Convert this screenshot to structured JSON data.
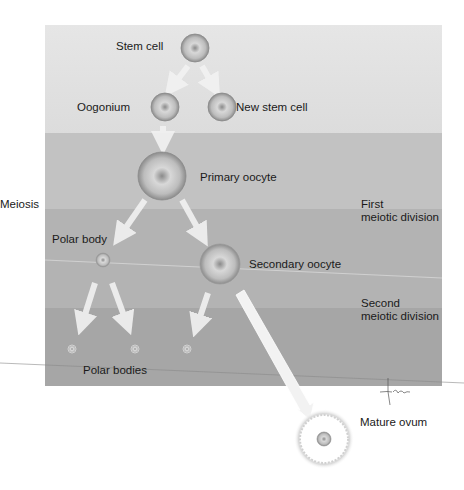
{
  "diagram": {
    "stages": {
      "stem_cell": "Stem cell",
      "oogonium": "Oogonium",
      "new_stem_cell": "New stem cell",
      "primary_oocyte": "Primary oocyte",
      "polar_body": "Polar body",
      "secondary_oocyte": "Secondary oocyte",
      "polar_bodies": "Polar bodies",
      "mature_ovum": "Mature ovum"
    },
    "process_label": "Meiosis",
    "phases": {
      "first_line1": "First",
      "first_line2": "meiotic division",
      "second_line1": "Second",
      "second_line2": "meiotic division"
    },
    "colors": {
      "band1": "#e0e0e0",
      "band2": "#c2c2c2",
      "band3": "#b3b3b3",
      "band4": "#a6a6a6",
      "arrow": "#f2f2f2",
      "cell": "#9a9a9a"
    }
  }
}
